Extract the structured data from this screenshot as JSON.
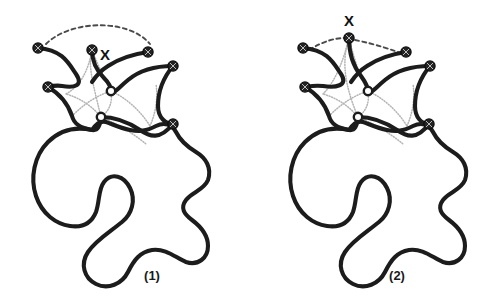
{
  "figure": {
    "background_color": "#ffffff",
    "width": 481,
    "height": 302,
    "curve_color": "#1c1c1c",
    "node_fill_color": "#232323",
    "hollow_node_fill_color": "#ffffff",
    "dotted_link_color": "#b4b4b4",
    "dashed_arc_color": "#4a4a4a",
    "label_color": "#111111"
  },
  "panels": [
    {
      "id": "panel-1",
      "caption": "(1)",
      "caption_x": 152,
      "caption_y": 277,
      "x_marker": {
        "label": "X",
        "label_x": 105,
        "label_y": 56,
        "node_x": 92,
        "node_y": 50
      },
      "filled_nodes": [
        {
          "name": "node-left-top",
          "cx": 38,
          "cy": 48
        },
        {
          "name": "node-x",
          "cx": 92,
          "cy": 50
        },
        {
          "name": "node-right-top",
          "cx": 148,
          "cy": 52
        },
        {
          "name": "node-far-right",
          "cx": 173,
          "cy": 66
        },
        {
          "name": "node-left-mid",
          "cx": 48,
          "cy": 87
        },
        {
          "name": "node-right-lower",
          "cx": 173,
          "cy": 124
        }
      ],
      "hollow_nodes": [
        {
          "name": "node-hollow-upper",
          "cx": 111,
          "cy": 91
        },
        {
          "name": "node-hollow-lower",
          "cx": 101,
          "cy": 117
        }
      ],
      "dashed_arc_path": "M 46 44 C 70 20 128 18 150 44",
      "strand_paths": [
        "M 38 48 C 62 50 68 62 76 74 C 84 86 74 88 62 86 C 56 85 52 86 48 87",
        "M 92 50 C 92 62 96 70 104 78 C 110 84 111 87 111 91",
        "M 148 52 C 134 54 120 58 108 66 C 100 71 96 76 92 82",
        "M 173 66 C 155 66 140 70 128 80 C 116 90 112 96 111 91",
        "M 173 66 C 163 78 158 92 158 106 C 158 118 166 124 173 124",
        "M 48 87 C 60 94 68 104 72 116 C 74 124 80 128 92 130 C 98 131 100 126 101 117",
        "M 101 117 C 114 117 128 122 140 130 C 150 137 160 140 173 124"
      ],
      "dotted_link_paths": [
        "M 92 50 C 88 66 92 80 101 117",
        "M 92 50 C 100 70 106 82 111 91",
        "M 111 91 C 96 96 84 104 72 116",
        "M 111 91 C 126 98 140 110 150 126",
        "M 101 117 C 92 106 80 98 66 94",
        "M 101 117 C 118 124 134 134 146 144",
        "M 66 94 C 80 86 88 72 92 50",
        "M 150 126 C 156 112 158 98 156 84",
        "M 111 91 C 113 104 108 112 101 117"
      ],
      "blob_path": "M 92 130 C 74 126 60 130 48 142 C 34 156 30 178 36 196 C 42 214 56 224 70 226 C 84 228 92 222 96 212 C 100 200 98 190 104 182 C 112 172 124 176 130 188 C 136 200 132 214 122 222 C 110 232 96 240 88 252 C 80 264 84 278 96 284 C 108 290 122 284 128 272 C 134 260 140 252 152 250 C 166 248 176 258 186 262 C 198 266 208 258 208 246 C 208 234 200 226 192 220 C 184 214 180 208 186 200 C 192 192 204 190 208 180 C 212 168 206 158 196 152 C 186 146 180 140 176 132 C 172 124 164 122 156 126 C 146 131 140 132 130 130 C 120 128 112 124 106 122 C 100 120 96 124 92 130 Z"
    },
    {
      "id": "panel-2",
      "caption": "(2)",
      "caption_x": 156,
      "caption_y": 277,
      "x_marker": {
        "label": "X",
        "label_x": 108,
        "label_y": 22,
        "node_x": 108,
        "node_y": 38
      },
      "filled_nodes": [
        {
          "name": "node-left-top",
          "cx": 62,
          "cy": 48
        },
        {
          "name": "node-x",
          "cx": 108,
          "cy": 38
        },
        {
          "name": "node-right-top",
          "cx": 165,
          "cy": 52
        },
        {
          "name": "node-far-right",
          "cx": 189,
          "cy": 66
        },
        {
          "name": "node-left-mid",
          "cx": 64,
          "cy": 87
        },
        {
          "name": "node-right-lower",
          "cx": 188,
          "cy": 124
        }
      ],
      "hollow_nodes": [
        {
          "name": "node-hollow-upper",
          "cx": 127,
          "cy": 91
        },
        {
          "name": "node-hollow-lower",
          "cx": 117,
          "cy": 117
        }
      ],
      "dashed_arc_path": "M 68 50 C 84 40 96 38 104 38 M 114 40 C 134 44 152 50 162 54",
      "strand_paths": [
        "M 62 48 C 86 50 92 62 100 74 C 108 86 94 88 82 86 C 74 85 70 86 64 87",
        "M 108 38 C 108 54 112 66 120 76 C 125 83 127 87 127 91",
        "M 165 52 C 151 54 138 58 126 66 C 118 71 114 76 110 82",
        "M 189 66 C 171 66 156 70 144 80 C 132 90 128 96 127 91",
        "M 189 66 C 179 78 174 92 174 106 C 174 118 181 124 188 124",
        "M 64 87 C 76 94 84 104 88 116 C 90 124 96 128 108 130 C 114 131 116 126 117 117",
        "M 117 117 C 130 117 144 122 156 130 C 166 137 176 140 188 124"
      ],
      "dotted_link_paths": [
        "M 108 38 C 100 62 104 86 117 117",
        "M 108 38 C 114 62 120 80 127 91",
        "M 127 91 C 112 96 100 104 88 116",
        "M 127 91 C 142 98 156 110 166 126",
        "M 117 117 C 108 106 96 98 82 94",
        "M 117 117 C 134 124 150 134 162 144",
        "M 82 94 C 94 82 102 62 108 38",
        "M 166 126 C 172 112 174 98 172 84",
        "M 127 91 C 129 104 124 112 117 117"
      ],
      "blob_path": "M 108 130 C 90 126 76 130 64 142 C 50 156 46 178 52 196 C 58 214 72 224 86 226 C 100 228 108 222 112 212 C 116 200 114 190 120 182 C 128 172 140 176 146 188 C 152 200 148 214 138 222 C 126 232 112 240 104 252 C 96 264 100 278 112 284 C 124 290 138 284 144 272 C 150 260 156 252 168 250 C 182 248 192 258 202 262 C 214 266 224 258 224 246 C 224 234 216 226 208 220 C 200 214 196 208 202 200 C 208 192 220 190 224 180 C 228 168 222 158 212 152 C 202 146 196 140 192 132 C 188 124 180 122 172 126 C 162 131 156 132 146 130 C 136 128 128 124 122 122 C 116 120 112 124 108 130 Z"
    }
  ]
}
